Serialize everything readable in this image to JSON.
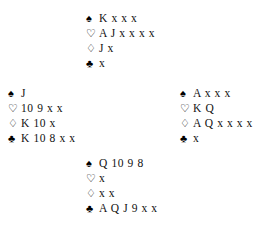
{
  "diagram": {
    "type": "bridge-deal-diagram",
    "suit_symbols": {
      "spade": "♠",
      "heart": "♡",
      "diamond": "♢",
      "club": "♣"
    },
    "suit_colors": {
      "spade": "#000000",
      "heart": "#000000",
      "diamond": "#000000",
      "club": "#000000"
    },
    "background": "#ffffff",
    "text_color": "#121212"
  },
  "hands": {
    "north": {
      "label": "North",
      "spades": "K x x x",
      "hearts": "A J x x x x",
      "diamonds": "J x",
      "clubs": "x"
    },
    "west": {
      "label": "West",
      "spades": "J",
      "hearts": "10 9 x x",
      "diamonds": "K 10 x",
      "clubs": "K 10 8 x x"
    },
    "east": {
      "label": "East",
      "spades": "A x x x",
      "hearts": "K Q",
      "diamonds": "A Q x x x x",
      "clubs": "x"
    },
    "south": {
      "label": "South",
      "spades": "Q 10 9 8",
      "hearts": "x",
      "diamonds": "x x",
      "clubs": "A Q J 9 x x"
    }
  }
}
